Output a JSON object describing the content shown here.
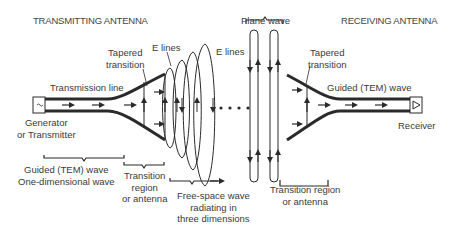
{
  "titles": {
    "transmitting": "TRANSMITTING ANTENNA",
    "receiving": "RECEIVING ANTENNA"
  },
  "labels": {
    "transmission_line": "Transmission line",
    "tapered_left_1": "Tapered",
    "tapered_left_2": "transition",
    "e_lines_left": "E lines",
    "e_lines_right": "E lines",
    "plane_wave": "Plane wave",
    "tapered_right_1": "Tapered",
    "tapered_right_2": "transition",
    "guided_right": "Guided (TEM) wave",
    "generator_1": "Generator",
    "generator_2": "or Transmitter",
    "receiver": "Receiver",
    "guided_left_1": "Guided (TEM) wave",
    "guided_left_2": "One-dimensional wave",
    "transition_left_1": "Transition",
    "transition_left_2": "region",
    "transition_left_3": "or antenna",
    "free_space_1": "Free-space wave",
    "free_space_2": "radiating in",
    "free_space_3": "three dimensions",
    "transition_right_1": "Transition region",
    "transition_right_2": "or antenna"
  },
  "colors": {
    "line": "#2a2a2a",
    "text": "#3a3a3a",
    "background": "#ffffff"
  }
}
